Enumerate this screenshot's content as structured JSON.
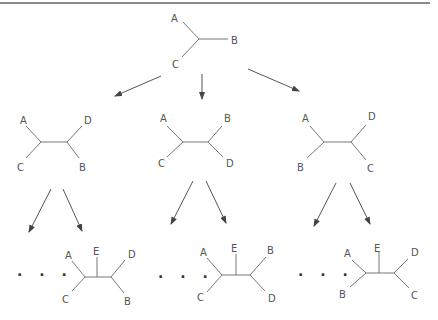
{
  "root_tree": {
    "labels": [
      "A",
      "B",
      "C"
    ]
  },
  "level2_trees": [
    {
      "labels": {
        "top_left": "A",
        "bottom_left": "C",
        "top_right": "D",
        "bottom_right": "B"
      }
    },
    {
      "labels": {
        "top_left": "A",
        "bottom_left": "C",
        "top_right": "B",
        "bottom_right": "D"
      }
    },
    {
      "labels": {
        "top_left": "A",
        "bottom_left": "B",
        "top_right": "D",
        "bottom_right": "C"
      }
    }
  ],
  "level3_trees": [
    {
      "ellipsis": ". . .",
      "labels": {
        "top_left": "A",
        "bottom_left": "C",
        "middle": "E",
        "top_right": "D",
        "bottom_right": "B"
      }
    },
    {
      "ellipsis": ". . .",
      "labels": {
        "top_left": "A",
        "bottom_left": "C",
        "middle": "E",
        "top_right": "B",
        "bottom_right": "D"
      }
    },
    {
      "ellipsis": ". . .",
      "labels": {
        "top_left": "A",
        "bottom_left": "B",
        "middle": "E",
        "top_right": "D",
        "bottom_right": "C"
      }
    }
  ]
}
